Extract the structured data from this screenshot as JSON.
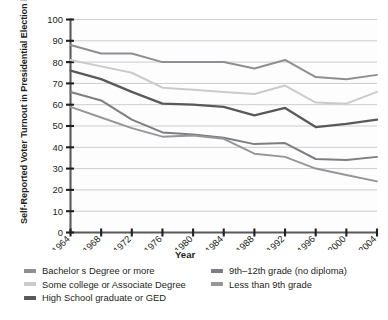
{
  "chart_data": {
    "type": "line",
    "title": "",
    "xlabel": "Year",
    "ylabel": "Self-Reported Voter Turnout in Presidential Election by Education (in percent)",
    "x": [
      1964,
      1968,
      1972,
      1976,
      1980,
      1984,
      1988,
      1992,
      1996,
      2000,
      2004
    ],
    "xtick_labels": [
      "1964",
      "1968",
      "1972",
      "1976",
      "1980",
      "1984",
      "1988",
      "1992",
      "1996",
      "2000",
      "2004"
    ],
    "ytick_labels": [
      "0",
      "10",
      "20",
      "30",
      "40",
      "50",
      "60",
      "70",
      "80",
      "90",
      "100"
    ],
    "yticks": [
      0,
      10,
      20,
      30,
      40,
      50,
      60,
      70,
      80,
      90,
      100
    ],
    "ylim": [
      0,
      100
    ],
    "grid": "horizontal",
    "legend_position": "bottom",
    "series": [
      {
        "name": "Bachelor s Degree or more",
        "color": "#8d8f92",
        "width": 2.0,
        "values": [
          88,
          84,
          84,
          80,
          80,
          80,
          77,
          81,
          73,
          72,
          74
        ]
      },
      {
        "name": "Some college or Associate Degree",
        "color": "#c9cbcd",
        "width": 2.0,
        "values": [
          81,
          78,
          75,
          68,
          67,
          66,
          65,
          69,
          61,
          60.5,
          66
        ]
      },
      {
        "name": "High School graduate or GED",
        "color": "#58595b",
        "width": 2.3,
        "values": [
          76,
          72,
          66,
          60.5,
          60,
          59,
          55,
          58.5,
          49.5,
          51,
          53
        ]
      },
      {
        "name": "9th–12th grade (no diploma)",
        "color": "#7c7e81",
        "width": 2.0,
        "values": [
          66,
          62,
          53,
          47,
          46,
          44.5,
          41.5,
          42,
          34.5,
          34,
          35.5
        ]
      },
      {
        "name": "Less than 9th grade",
        "color": "#949699",
        "width": 2.0,
        "values": [
          59,
          54,
          49,
          45,
          45.5,
          44,
          37,
          35.5,
          30,
          27,
          24
        ]
      }
    ]
  },
  "axis": {
    "x_title": "Year"
  },
  "legend": {
    "columns": [
      {
        "items": [
          {
            "label": "Bachelor s Degree or more",
            "color": "#8d8f92"
          },
          {
            "label": "Some college or Associate Degree",
            "color": "#c9cbcd"
          },
          {
            "label": "High School graduate or GED",
            "color": "#58595b"
          }
        ]
      },
      {
        "items": [
          {
            "label": "9th–12th grade (no diploma)",
            "color": "#7c7e81"
          },
          {
            "label": "Less than 9th grade",
            "color": "#949699"
          }
        ]
      }
    ]
  }
}
